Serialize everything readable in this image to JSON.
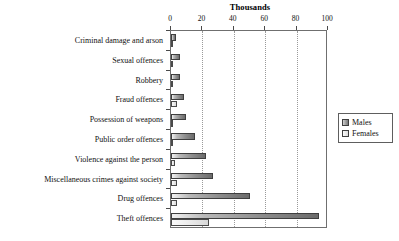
{
  "chart_data": {
    "type": "bar",
    "orientation": "horizontal",
    "title": "Thousands",
    "xlabel": "",
    "ylabel": "",
    "xlim": [
      0,
      100
    ],
    "xticks": [
      0,
      20,
      40,
      60,
      80,
      100
    ],
    "grid": true,
    "legend_position": "right",
    "categories": [
      "Criminal damage and arson",
      "Sexual offences",
      "Robbery",
      "Fraud offences",
      "Possession of weapons",
      "Public order offences",
      "Violence against the person",
      "Miscellaneous crimes against society",
      "Drug offences",
      "Theft offences"
    ],
    "series": [
      {
        "name": "Males",
        "values": [
          3,
          6,
          5.5,
          8.5,
          9.5,
          15.5,
          22,
          27,
          50,
          94
        ]
      },
      {
        "name": "Females",
        "values": [
          0.5,
          0.2,
          0.4,
          4,
          0.6,
          1.5,
          2.5,
          4,
          4,
          24
        ]
      }
    ]
  },
  "legend": {
    "items": [
      {
        "label": "Males",
        "swatch": "males"
      },
      {
        "label": "Females",
        "swatch": "females"
      }
    ]
  },
  "colors": {
    "males": "#8e8e8e",
    "females": "#e8e8e8",
    "axis": "#6f6f6f",
    "grid": "#9a9a9a"
  }
}
